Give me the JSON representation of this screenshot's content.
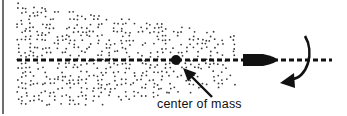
{
  "diagram": {
    "label": "center of mass",
    "label_pos": {
      "x": 157,
      "y": 97
    },
    "colors": {
      "ink": "#111111",
      "dots": "#3a3a3a",
      "border": "#6e6e6e",
      "background": "#ffffff"
    },
    "axis": {
      "x1": 17,
      "x2": 332,
      "y": 60
    },
    "center_of_mass": {
      "cx": 176,
      "cy": 60,
      "r": 5
    },
    "projectile": {
      "x_tail": 243,
      "x_tip": 277,
      "y": 60,
      "half_height": 6
    },
    "pointer_arrow": {
      "x1": 212,
      "y1": 97,
      "x2": 183,
      "y2": 68
    },
    "rotation_arrow": {
      "cx": 303,
      "cy": 62,
      "rx": 18,
      "ry": 26
    },
    "cloud": {
      "x_left": 18,
      "x_right": 235,
      "y_top": 4,
      "y_bottom": 106
    }
  }
}
